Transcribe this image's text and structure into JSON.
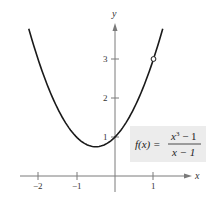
{
  "chart_data": {
    "type": "line",
    "title": "",
    "xlabel": "x",
    "ylabel": "y",
    "xlim": [
      -2.5,
      1.9
    ],
    "ylim": [
      -0.4,
      4.0
    ],
    "grid": false,
    "x_ticks": [
      {
        "value": -2,
        "label": "−2"
      },
      {
        "value": -1,
        "label": "−1"
      },
      {
        "value": 1,
        "label": "1"
      }
    ],
    "y_ticks": [
      {
        "value": 1,
        "label": "1"
      },
      {
        "value": 2,
        "label": "2"
      },
      {
        "value": 3,
        "label": "3"
      }
    ],
    "series": [
      {
        "name": "f(x) = (x^3 - 1)/(x - 1)",
        "equivalent": "x^2 + x + 1, x != 1",
        "domain": [
          -2.24,
          1.24
        ],
        "points": [
          {
            "x": -2.24,
            "y": 3.78
          },
          {
            "x": -2,
            "y": 3
          },
          {
            "x": -1.5,
            "y": 1.75
          },
          {
            "x": -1,
            "y": 1
          },
          {
            "x": -0.5,
            "y": 0.75
          },
          {
            "x": 0,
            "y": 1
          },
          {
            "x": 0.5,
            "y": 1.75
          },
          {
            "x": 1,
            "y": 3
          },
          {
            "x": 1.24,
            "y": 3.78
          }
        ],
        "color": "#1a1a1a"
      }
    ],
    "annotations": [
      {
        "type": "open-circle",
        "x": 1,
        "y": 3,
        "note": "hole (removable discontinuity)"
      },
      {
        "type": "label",
        "text": "f(x) = (x³ − 1)/(x − 1)"
      }
    ]
  },
  "axes": {
    "x_label": "x",
    "y_label": "y"
  },
  "ticks": {
    "x": [
      "−2",
      "−1",
      "1"
    ],
    "y": [
      "1",
      "2",
      "3"
    ]
  },
  "function_label": {
    "lhs": "f(x) =",
    "numerator_base": "x",
    "numerator_exp": "3",
    "numerator_rest": " − 1",
    "denominator": "x − 1"
  },
  "colors": {
    "curve": "#1a1a1a",
    "axis": "#7a7a7a",
    "label_box": "#ececec"
  }
}
